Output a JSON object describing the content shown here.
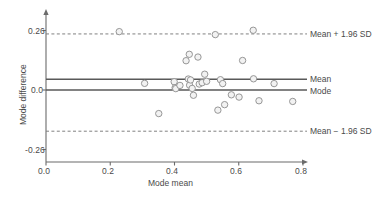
{
  "chart_data": {
    "type": "scatter",
    "title": "",
    "xlabel": "Mode mean",
    "ylabel": "Mode difference",
    "xlim": [
      0.0,
      0.8
    ],
    "ylim": [
      -0.3,
      0.3
    ],
    "xticks": [
      "0.0",
      "0.2",
      "0.4",
      "0.6",
      "0.8"
    ],
    "xtick_values": [
      0.0,
      0.2,
      0.4,
      0.6,
      0.8
    ],
    "yticks": [
      "0.26",
      "0.0",
      "-0.26"
    ],
    "ytick_values": [
      0.26,
      0.0,
      -0.26
    ],
    "grid": false,
    "marker": {
      "shape": "open-circle",
      "fill": "#f2f2f2",
      "stroke": "#8c8c8c",
      "radius": 3.2
    },
    "reference_lines": [
      {
        "name": "upper-loa",
        "label": "Mean + 1.96 SD",
        "value": 0.245,
        "style": "dashed",
        "color": "#808080"
      },
      {
        "name": "mean",
        "label": "Mean",
        "value": 0.047,
        "style": "solid",
        "color": "#595959"
      },
      {
        "name": "mode",
        "label": "Mode",
        "value": 0.0,
        "style": "solid",
        "color": "#595959"
      },
      {
        "name": "lower-loa",
        "label": "Mean − 1.96 SD",
        "value": -0.18,
        "style": "dashed",
        "color": "#808080"
      }
    ],
    "points": [
      {
        "x": 0.228,
        "y": 0.255
      },
      {
        "x": 0.307,
        "y": 0.029
      },
      {
        "x": 0.351,
        "y": -0.103
      },
      {
        "x": 0.399,
        "y": 0.036
      },
      {
        "x": 0.402,
        "y": 0.01
      },
      {
        "x": 0.404,
        "y": 0.006
      },
      {
        "x": 0.417,
        "y": 0.02
      },
      {
        "x": 0.436,
        "y": 0.128
      },
      {
        "x": 0.443,
        "y": 0.048
      },
      {
        "x": 0.446,
        "y": 0.156
      },
      {
        "x": 0.447,
        "y": 0.021
      },
      {
        "x": 0.45,
        "y": 0.044
      },
      {
        "x": 0.455,
        "y": 0.007
      },
      {
        "x": 0.459,
        "y": -0.023
      },
      {
        "x": 0.473,
        "y": 0.144
      },
      {
        "x": 0.477,
        "y": 0.026
      },
      {
        "x": 0.486,
        "y": 0.032
      },
      {
        "x": 0.494,
        "y": 0.069
      },
      {
        "x": 0.5,
        "y": 0.038
      },
      {
        "x": 0.527,
        "y": 0.242
      },
      {
        "x": 0.535,
        "y": -0.088
      },
      {
        "x": 0.543,
        "y": 0.045
      },
      {
        "x": 0.55,
        "y": 0.028
      },
      {
        "x": 0.556,
        "y": -0.064
      },
      {
        "x": 0.577,
        "y": -0.021
      },
      {
        "x": 0.601,
        "y": -0.031
      },
      {
        "x": 0.612,
        "y": 0.129
      },
      {
        "x": 0.645,
        "y": 0.261
      },
      {
        "x": 0.646,
        "y": 0.049
      },
      {
        "x": 0.663,
        "y": -0.047
      },
      {
        "x": 0.71,
        "y": 0.028
      },
      {
        "x": 0.768,
        "y": -0.05
      }
    ]
  },
  "axes": {
    "x_arrow": true,
    "y_arrow": true
  }
}
